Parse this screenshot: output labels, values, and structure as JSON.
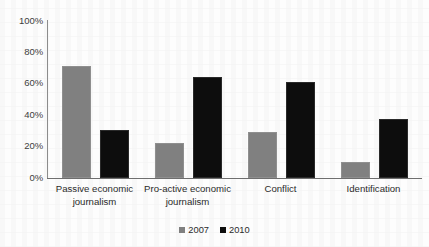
{
  "chart_data": {
    "type": "bar",
    "title": "",
    "subtitle": "",
    "xlabel": "",
    "ylabel": "",
    "ylim": [
      0,
      100
    ],
    "y_tick_labels": [
      "100%",
      "80%",
      "60%",
      "40%",
      "20%",
      "0%"
    ],
    "y_tick_values": [
      100,
      80,
      60,
      40,
      20,
      0
    ],
    "grid": false,
    "legend_position": "bottom",
    "categories": [
      "Passive economic journalism",
      "Pro-active economic journalism",
      "Conflict",
      "Identification"
    ],
    "category_lines": [
      [
        "Passive economic",
        "journalism"
      ],
      [
        "Pro-active economic",
        "journalism"
      ],
      [
        "Conflict"
      ],
      [
        "Identification"
      ]
    ],
    "series": [
      {
        "name": "2007",
        "color": "#808080",
        "values": [
          70,
          21,
          28,
          9
        ]
      },
      {
        "name": "2010",
        "color": "#0d0d0d",
        "values": [
          29,
          63,
          60,
          36
        ]
      }
    ]
  },
  "legend": {
    "entries": [
      {
        "label": "2007",
        "color": "#808080"
      },
      {
        "label": "2010",
        "color": "#0d0d0d"
      }
    ]
  },
  "axis": {
    "y_labels": [
      "100%",
      "80%",
      "60%",
      "40%",
      "20%",
      "0%"
    ]
  }
}
